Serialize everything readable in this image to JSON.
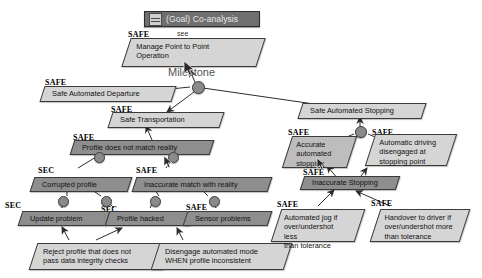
{
  "window": {
    "title": "(Goal) Co-analysis",
    "icon": "goal-diagram-icon"
  },
  "annotations": {
    "see": "see",
    "milestone": "Milestone"
  },
  "tags": {
    "safe": "SAFE",
    "sec": "SEC"
  },
  "nodes": [
    {
      "id": "manage-point-to-point-operation",
      "label": "Manage Point to Point\nOperation",
      "tag": "SAFE",
      "fill": "light"
    },
    {
      "id": "safe-automated-departure",
      "label": "Safe Automated Departure",
      "tag": "SAFE",
      "fill": "light"
    },
    {
      "id": "safe-transportation",
      "label": "Safe Transportation",
      "tag": "SAFE",
      "fill": "light"
    },
    {
      "id": "safe-automated-stopping",
      "label": "Safe Automated Stopping",
      "tag": "",
      "fill": "light"
    },
    {
      "id": "profile-does-not-match-reality",
      "label": "Profile does not match reality",
      "tag": "SAFE",
      "fill": "dark"
    },
    {
      "id": "corrupted-profile",
      "label": "Corrupted profile",
      "tag": "SEC",
      "fill": "dark"
    },
    {
      "id": "inaccurate-match-with-reality",
      "label": "Inaccurate match with reality",
      "tag": "SAFE",
      "fill": "dark"
    },
    {
      "id": "update-problem",
      "label": "Update problem",
      "tag": "SEC",
      "fill": "dark"
    },
    {
      "id": "profile-hacked",
      "label": "Profile hacked",
      "tag": "SEC",
      "fill": "dark"
    },
    {
      "id": "sensor-problems",
      "label": "Sensor problems",
      "tag": "SAFE",
      "fill": "dark"
    },
    {
      "id": "reject-profile",
      "label": "Reject profile that does not\npass data integrity checks",
      "tag": "",
      "fill": "light"
    },
    {
      "id": "disengage-automated-mode",
      "label": "Disengage automated mode\nWHEN profile inconsistent",
      "tag": "",
      "fill": "light"
    },
    {
      "id": "accurate-automated-stopping",
      "label": "Accurate\nautomated\nstopping",
      "tag": "SAFE",
      "fill": "mid"
    },
    {
      "id": "automatic-driving-disengaged",
      "label": "Automatic driving\ndisengaged at\nstopping point",
      "tag": "SAFE",
      "fill": "light"
    },
    {
      "id": "inaccurate-stopping",
      "label": "Inaccurate Stopping",
      "tag": "SAFE",
      "fill": "dark"
    },
    {
      "id": "automated-jog",
      "label": "Automated jog if\nover/undershot less\nthan tolerance",
      "tag": "SAFE",
      "fill": "light"
    },
    {
      "id": "handover-to-driver",
      "label": "Handover to driver if\nover/undershot more\nthan tolerance",
      "tag": "SAFE",
      "fill": "light"
    }
  ],
  "colors": {
    "node_border": "#3a3a3a",
    "fill_light": "#d5d5d5",
    "fill_mid": "#bdbdbd",
    "fill_dark": "#8e8e8e",
    "titlebar": "#6f6f6f",
    "edge": "#2d2d2d",
    "junction": "#8a8a8a"
  }
}
